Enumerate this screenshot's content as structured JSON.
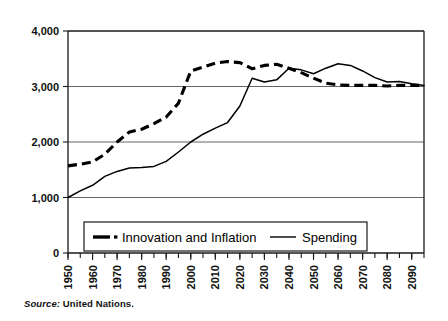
{
  "source_note": {
    "prefix": "Source:",
    "text": "United Nations."
  },
  "chart_data": {
    "type": "line",
    "title": "",
    "subtitle": "",
    "xlabel": "",
    "ylabel": "",
    "xlim": [
      1950,
      2095
    ],
    "ylim": [
      0,
      4000
    ],
    "grid": true,
    "grid_axis": "y",
    "legend_position": "inside-bottom-left",
    "y_ticks": [
      0,
      1000,
      2000,
      3000,
      4000
    ],
    "y_tick_labels": [
      "0",
      "1,000",
      "2,000",
      "3,000",
      "4,000"
    ],
    "x_ticks": [
      1950,
      1960,
      1970,
      1980,
      1990,
      2000,
      2010,
      2020,
      2030,
      2040,
      2050,
      2060,
      2070,
      2080,
      2090
    ],
    "x_tick_labels": [
      "1950",
      "1960",
      "1970",
      "1980",
      "1990",
      "2000",
      "2010",
      "2020",
      "2030",
      "2040",
      "2050",
      "2060",
      "2070",
      "2080",
      "2090"
    ],
    "x_minor_tick_interval": 5,
    "x": [
      1950,
      1955,
      1960,
      1965,
      1970,
      1975,
      1980,
      1985,
      1990,
      1995,
      2000,
      2005,
      2010,
      2015,
      2020,
      2025,
      2030,
      2035,
      2040,
      2045,
      2050,
      2055,
      2060,
      2065,
      2070,
      2075,
      2080,
      2085,
      2090,
      2095
    ],
    "series": [
      {
        "name": "Innovation and Inflation",
        "style": "dashed",
        "color": "#000000",
        "values": [
          1570,
          1600,
          1640,
          1780,
          2000,
          2180,
          2230,
          2330,
          2450,
          2700,
          3280,
          3350,
          3420,
          3450,
          3430,
          3320,
          3380,
          3400,
          3330,
          3250,
          3150,
          3060,
          3030,
          3020,
          3020,
          3020,
          3010,
          3020,
          3020,
          3020
        ]
      },
      {
        "name": "Spending",
        "style": "solid",
        "color": "#000000",
        "values": [
          1000,
          1120,
          1220,
          1380,
          1470,
          1530,
          1540,
          1560,
          1650,
          1820,
          2000,
          2140,
          2250,
          2350,
          2650,
          3150,
          3080,
          3120,
          3330,
          3300,
          3230,
          3330,
          3410,
          3380,
          3280,
          3160,
          3080,
          3090,
          3050,
          3020
        ]
      }
    ]
  }
}
